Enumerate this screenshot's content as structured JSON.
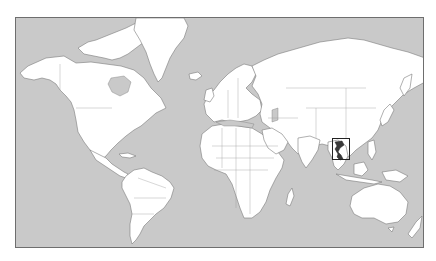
{
  "map": {
    "projection": "Mercator world outline",
    "colors": {
      "ocean": "#c9c9c9",
      "land": "#ffffff",
      "border": "#7a7a7a",
      "highlight": "#3a3a3a",
      "frame": "#6e6e6e"
    },
    "highlight": {
      "region": "Vietnam",
      "box": {
        "left": 316,
        "top": 120,
        "width": 18,
        "height": 22
      }
    }
  }
}
